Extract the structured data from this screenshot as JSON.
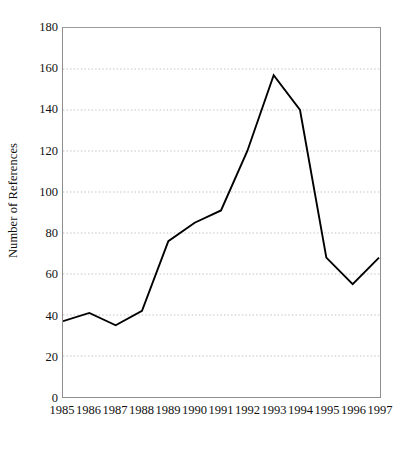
{
  "chart_data": {
    "type": "line",
    "title": "",
    "subtitle": "",
    "xlabel": "",
    "ylabel": "Number of References",
    "x": [
      1985,
      1986,
      1987,
      1988,
      1989,
      1990,
      1991,
      1992,
      1993,
      1994,
      1995,
      1996,
      1997
    ],
    "categories": [
      "1985",
      "1986",
      "1987",
      "1988",
      "1989",
      "1990",
      "1991",
      "1992",
      "1993",
      "1994",
      "1995",
      "1996",
      "1997"
    ],
    "values": [
      37,
      41,
      35,
      42,
      76,
      85,
      91,
      120,
      157,
      140,
      68,
      55,
      68
    ],
    "series": [
      {
        "name": "Number of References",
        "values": [
          37,
          41,
          35,
          42,
          76,
          85,
          91,
          120,
          157,
          140,
          68,
          55,
          68
        ]
      }
    ],
    "ylim": [
      0,
      180
    ],
    "xlim": [
      1985,
      1997
    ],
    "y_ticks": [
      0,
      20,
      40,
      60,
      80,
      100,
      120,
      140,
      160,
      180
    ],
    "y_tick_labels": [
      "0",
      "20",
      "40",
      "60",
      "80",
      "100",
      "120",
      "140",
      "160",
      "180"
    ],
    "x_ticks": [
      1985,
      1986,
      1987,
      1988,
      1989,
      1990,
      1991,
      1992,
      1993,
      1994,
      1995,
      1996,
      1997
    ],
    "x_tick_labels": [
      "1985",
      "1986",
      "1987",
      "1988",
      "1989",
      "1990",
      "1991",
      "1992",
      "1993",
      "1994",
      "1995",
      "1996",
      "1997"
    ],
    "grid": true,
    "grid_axis": "y",
    "grid_style": "dotted",
    "grid_values": [
      20,
      40,
      60,
      80,
      100,
      120,
      140,
      160
    ],
    "legend": false,
    "legend_position": "none",
    "markers": false,
    "annotations": [],
    "colors": {
      "line": "#000000",
      "grid": "#b9b9b9",
      "frame": "#8e8e8e",
      "background": "#ffffff",
      "text": "#111111"
    },
    "line_width": 1.9
  }
}
